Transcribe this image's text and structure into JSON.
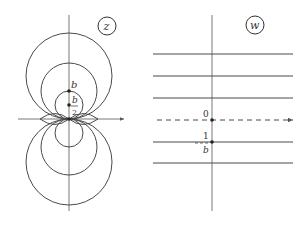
{
  "z_plane": {
    "label": "z",
    "circles_upper": [
      {
        "name": "small",
        "cx": 69,
        "cy": 105,
        "r": 14
      },
      {
        "name": "medium",
        "cx": 69,
        "cy": 91,
        "r": 28
      },
      {
        "name": "large",
        "cx": 69,
        "cy": 76,
        "r": 43
      }
    ],
    "circles_lower": [
      {
        "name": "small",
        "cx": 69,
        "cy": 133,
        "r": 14
      },
      {
        "name": "medium",
        "cx": 69,
        "cy": 147,
        "r": 28
      },
      {
        "name": "large",
        "cx": 69,
        "cy": 162,
        "r": 43
      }
    ],
    "point_labels": {
      "b": "b",
      "b_half_num": "b",
      "b_half_den": "2"
    }
  },
  "w_plane": {
    "label": "w",
    "lines_y": [
      54,
      76,
      98,
      142,
      163
    ],
    "dashed_line_y": 120,
    "origin_label": "0",
    "point_label_num": "1",
    "point_label_den": "b"
  }
}
